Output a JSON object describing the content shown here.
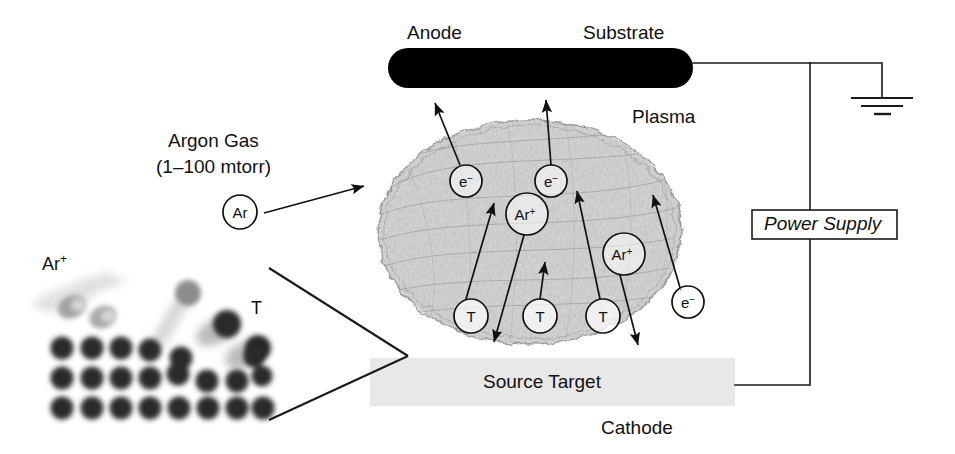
{
  "figure": {
    "width": 955,
    "height": 454
  },
  "labels": {
    "anode": "Anode",
    "substrate": "Substrate",
    "plasma": "Plasma",
    "argon_gas": "Argon Gas",
    "argon_pressure": "(1–100 mtorr)",
    "power_supply": "Power Supply",
    "source_target": "Source Target",
    "cathode": "Cathode",
    "inset_ion": "Ar",
    "inset_ion_charge": "+",
    "inset_atom": "T"
  },
  "components": {
    "anode_bar": {
      "name": "Anode / Substrate electrode",
      "x": 388,
      "y": 48,
      "width": 305,
      "height": 40,
      "color": "#000000"
    },
    "target_bar": {
      "name": "Source Target electrode",
      "x": 370,
      "y": 358,
      "width": 365,
      "height": 48,
      "color": "#e8e8e8"
    },
    "plasma_cloud": {
      "name": "Plasma region",
      "cx": 530,
      "cy": 232,
      "rx": 152,
      "ry": 112,
      "color": "#b5b5b5"
    },
    "power_supply_box": {
      "x": 752,
      "y": 210,
      "width": 145,
      "height": 29,
      "color": "#ffffff"
    },
    "ground_symbol": {
      "x": 882,
      "y": 98,
      "bars": 3
    }
  },
  "particles": [
    {
      "id": "e1",
      "species": "electron",
      "symbol": "e",
      "charge": "−",
      "x": 466,
      "y": 181,
      "r": 16
    },
    {
      "id": "e2",
      "species": "electron",
      "symbol": "e",
      "charge": "−",
      "x": 551,
      "y": 181,
      "r": 16
    },
    {
      "id": "ar1",
      "species": "argon-ion",
      "symbol": "Ar",
      "charge": "+",
      "x": 527,
      "y": 214,
      "r": 21
    },
    {
      "id": "ar2",
      "species": "argon-ion",
      "symbol": "Ar",
      "charge": "+",
      "x": 624,
      "y": 254,
      "r": 21
    },
    {
      "id": "t1",
      "species": "target-atom",
      "symbol": "T",
      "charge": "",
      "x": 471,
      "y": 316,
      "r": 17
    },
    {
      "id": "t2",
      "species": "target-atom",
      "symbol": "T",
      "charge": "",
      "x": 540,
      "y": 316,
      "r": 17
    },
    {
      "id": "t3",
      "species": "target-atom",
      "symbol": "T",
      "charge": "",
      "x": 603,
      "y": 316,
      "r": 17
    },
    {
      "id": "e3",
      "species": "electron",
      "symbol": "e",
      "charge": "−",
      "x": 688,
      "y": 302,
      "r": 16
    },
    {
      "id": "ar-inlet",
      "species": "argon-neutral",
      "symbol": "Ar",
      "charge": "",
      "x": 240,
      "y": 212,
      "r": 17
    }
  ],
  "arrows": [
    {
      "name": "argon-inlet-arrow",
      "x1": 264,
      "y1": 213,
      "x2": 364,
      "y2": 186
    },
    {
      "name": "electron-e1-up",
      "x1": 460,
      "y1": 165,
      "x2": 435,
      "y2": 103
    },
    {
      "name": "electron-e2-up",
      "x1": 551,
      "y1": 165,
      "x2": 546,
      "y2": 100
    },
    {
      "name": "target-t1-up",
      "x1": 466,
      "y1": 299,
      "x2": 494,
      "y2": 203
    },
    {
      "name": "target-t2-up",
      "x1": 540,
      "y1": 299,
      "x2": 545,
      "y2": 262
    },
    {
      "name": "target-t3-up",
      "x1": 600,
      "y1": 299,
      "x2": 577,
      "y2": 191
    },
    {
      "name": "ion-ar1-down",
      "x1": 524,
      "y1": 235,
      "x2": 494,
      "y2": 342
    },
    {
      "name": "ion-ar2-down",
      "x1": 620,
      "y1": 275,
      "x2": 638,
      "y2": 345
    },
    {
      "name": "electron-e3-up",
      "x1": 681,
      "y1": 291,
      "x2": 653,
      "y2": 195
    }
  ],
  "wires": [
    {
      "name": "anode-to-node",
      "points": "693,63 810,63"
    },
    {
      "name": "node-to-ground",
      "points": "810,63 882,63 882,98"
    },
    {
      "name": "node-to-supply",
      "points": "810,63 810,210"
    },
    {
      "name": "supply-to-target",
      "points": "810,239 810,385 735,385"
    }
  ],
  "magnifier_lines": [
    {
      "name": "magnifier-upper",
      "points": "269,268 408,356"
    },
    {
      "name": "magnifier-lower",
      "points": "269,420 408,356"
    }
  ],
  "inset": {
    "name": "atomic-scale-sputtering-inset",
    "lattice_rows": 3,
    "lattice_columns": 8,
    "atom_color": "#2b2b2b",
    "ejected_atom_color": "#1f1f1f",
    "incoming_ion_color": "#9a9a9a"
  }
}
